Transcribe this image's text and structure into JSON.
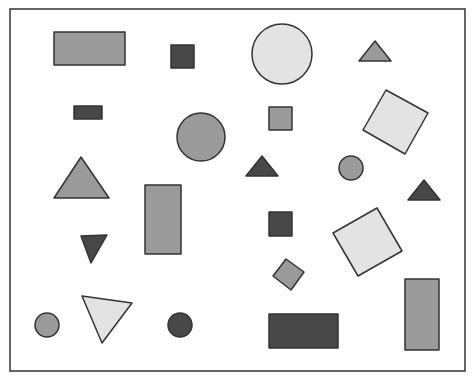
{
  "colors": {
    "background": "#ffffff",
    "stroke": "#333333",
    "light": "#e3e3e3",
    "medium": "#9a9a9a",
    "dark": "#474747"
  },
  "frame": {
    "x": 10,
    "y": 9,
    "w": 455,
    "h": 362
  },
  "shapes": [
    {
      "id": "rect-top-left",
      "type": "rect",
      "x": 54,
      "y": 32,
      "w": 71,
      "h": 33,
      "fill": "medium"
    },
    {
      "id": "square-top-dark",
      "type": "rect",
      "x": 171,
      "y": 45,
      "w": 23,
      "h": 23,
      "fill": "dark"
    },
    {
      "id": "circle-top-large",
      "type": "circle",
      "cx": 282,
      "cy": 54,
      "r": 30,
      "fill": "light"
    },
    {
      "id": "triangle-top-right",
      "type": "polygon",
      "points": "359,61 391,61 375,41",
      "fill": "medium"
    },
    {
      "id": "rect-small-dark",
      "type": "rect",
      "x": 74,
      "y": 106,
      "w": 28,
      "h": 13,
      "fill": "dark"
    },
    {
      "id": "circle-mid-medium",
      "type": "circle",
      "cx": 201,
      "cy": 137,
      "r": 24,
      "fill": "medium"
    },
    {
      "id": "square-mid-medium",
      "type": "rect",
      "x": 269,
      "y": 107,
      "w": 23,
      "h": 23,
      "fill": "medium"
    },
    {
      "id": "diamond-top-right",
      "type": "polygon",
      "points": "386,90 428,113 405,154 363,130",
      "fill": "light"
    },
    {
      "id": "triangle-left-medium",
      "type": "polygon",
      "points": "54,198 109,198 81,157",
      "fill": "medium"
    },
    {
      "id": "rect-tall-center",
      "type": "rect",
      "x": 145,
      "y": 185,
      "w": 36,
      "h": 69,
      "fill": "medium"
    },
    {
      "id": "triangle-center-dark",
      "type": "polygon",
      "points": "246,176 278,176 262,156",
      "fill": "dark"
    },
    {
      "id": "circle-small-right",
      "type": "circle",
      "cx": 351,
      "cy": 168,
      "r": 12,
      "fill": "medium"
    },
    {
      "id": "triangle-right-dark",
      "type": "polygon",
      "points": "408,200 440,200 424,180",
      "fill": "dark"
    },
    {
      "id": "square-center-dark",
      "type": "rect",
      "x": 269,
      "y": 212,
      "w": 23,
      "h": 24,
      "fill": "dark"
    },
    {
      "id": "diamond-right-lower",
      "type": "polygon",
      "points": "333,233 377,208 402,251 358,276",
      "fill": "light"
    },
    {
      "id": "triangle-down-dark",
      "type": "polygon",
      "points": "81,236 107,235 91,263",
      "fill": "dark"
    },
    {
      "id": "diamond-small-medium",
      "type": "polygon",
      "points": "273,276 286,259 304,272 291,290",
      "fill": "medium"
    },
    {
      "id": "triangle-down-light",
      "type": "polygon",
      "points": "82,296 132,303 102,343",
      "fill": "light"
    },
    {
      "id": "circle-bottom-left",
      "type": "circle",
      "cx": 47,
      "cy": 325,
      "r": 12,
      "fill": "medium"
    },
    {
      "id": "circle-bottom-dark",
      "type": "circle",
      "cx": 180,
      "cy": 325,
      "r": 12,
      "fill": "dark"
    },
    {
      "id": "rect-bottom-dark",
      "type": "rect",
      "x": 269,
      "y": 314,
      "w": 69,
      "h": 34,
      "fill": "dark"
    },
    {
      "id": "rect-bottom-right",
      "type": "rect",
      "x": 405,
      "y": 279,
      "w": 34,
      "h": 71,
      "fill": "medium"
    }
  ]
}
